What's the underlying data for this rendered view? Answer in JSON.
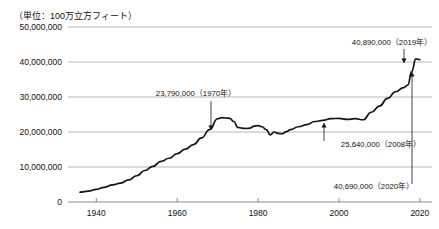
{
  "chart_data": {
    "type": "line",
    "title": "",
    "subtitle": "",
    "unit_label": "（単位：100万立方フィート）",
    "xlabel": "",
    "ylabel": "",
    "xlim": [
      1933,
      2023
    ],
    "ylim": [
      0,
      50000000
    ],
    "grid": true,
    "legend": "none",
    "y_ticks": [
      0,
      10000000,
      20000000,
      30000000,
      40000000,
      50000000
    ],
    "y_tick_labels": [
      "0",
      "10,000,000",
      "20,000,000",
      "30,000,000",
      "40,000,000",
      "50,000,000"
    ],
    "x_ticks": [
      1940,
      1960,
      1980,
      2000,
      2020
    ],
    "x_tick_labels": [
      "1940",
      "1960",
      "1980",
      "2000",
      "2020"
    ],
    "series": [
      {
        "name": "天然ガス生産量",
        "x": [
          1936,
          1938,
          1940,
          1942,
          1944,
          1946,
          1948,
          1950,
          1952,
          1954,
          1956,
          1958,
          1960,
          1962,
          1964,
          1966,
          1968,
          1970,
          1971,
          1972,
          1973,
          1974,
          1975,
          1976,
          1977,
          1978,
          1979,
          1980,
          1981,
          1982,
          1983,
          1984,
          1985,
          1986,
          1987,
          1988,
          1990,
          1992,
          1994,
          1996,
          1998,
          2000,
          2002,
          2004,
          2006,
          2008,
          2010,
          2012,
          2014,
          2016,
          2017,
          2018,
          2019,
          2020
        ],
        "values": [
          2800000,
          3100000,
          3600000,
          4200000,
          4900000,
          5400000,
          6300000,
          7500000,
          9000000,
          10200000,
          11600000,
          12500000,
          13800000,
          15100000,
          16400000,
          18300000,
          20700000,
          23790000,
          24100000,
          24000000,
          23900000,
          23000000,
          21300000,
          21100000,
          21000000,
          21100000,
          21700000,
          21800000,
          21500000,
          20700000,
          19200000,
          20000000,
          19600000,
          19500000,
          20100000,
          20700000,
          21500000,
          22100000,
          23000000,
          23300000,
          23800000,
          23900000,
          23600000,
          23800000,
          23500000,
          25640000,
          27400000,
          29600000,
          31500000,
          32700000,
          33400000,
          37300000,
          40890000,
          40690000
        ]
      }
    ],
    "annotations": [
      {
        "label": "23,790,000（1970年）",
        "year": 1970,
        "value": 23790000,
        "arrow": "down"
      },
      {
        "label": "40,890,000（2019年）",
        "year": 2019,
        "value": 40890000,
        "arrow": "down"
      },
      {
        "label": "25,640,000（2008年）",
        "year": 2008,
        "value": 25640000,
        "arrow": "up"
      },
      {
        "label": "40,690,000（2020年）",
        "year": 2020,
        "value": 40690000,
        "arrow": "up"
      }
    ]
  }
}
